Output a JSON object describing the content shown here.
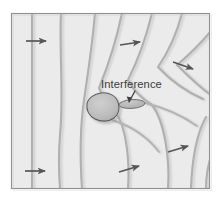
{
  "figure": {
    "frame": {
      "x": 11,
      "y": 13,
      "width": 199,
      "height": 176
    },
    "colors": {
      "page_background": "#ffffff",
      "field_background": "#ebebeb",
      "contour_line": "#b0b0b0",
      "contour_shadow": "#d8d8d8",
      "frame_border": "#8f8f8f",
      "arrow": "#55555a",
      "obstacle_fill": "#bdbdbd",
      "obstacle_outline": "#5c5c5c",
      "interference_fill": "#b8b8b8",
      "interference_outline": "#6a6a6a",
      "label_text": "#3b3b3b"
    },
    "annotations": [
      {
        "name": "interference-label",
        "text": "Interference",
        "text_x": 101,
        "text_y": 88,
        "leader_from": {
          "x": 134,
          "y": 92
        },
        "leader_to": {
          "x": 128,
          "y": 103
        }
      }
    ],
    "obstacle": {
      "name": "obstacle-blob",
      "center": {
        "x": 103,
        "y": 107
      },
      "radius_x": 16,
      "radius_y": 14
    },
    "interference_zone": {
      "name": "interference-ellipse",
      "center": {
        "x": 132,
        "y": 104
      },
      "radius_x": 13,
      "radius_y": 4.5,
      "rotation_deg": -4
    },
    "flow_arrows": [
      {
        "name": "flow-arrow-upper-left",
        "x1": 26,
        "y1": 41,
        "x2": 47,
        "y2": 41
      },
      {
        "name": "flow-arrow-upper-middle",
        "x1": 120,
        "y1": 45,
        "x2": 141,
        "y2": 42
      },
      {
        "name": "flow-arrow-upper-right",
        "x1": 173,
        "y1": 62,
        "x2": 194,
        "y2": 69
      },
      {
        "name": "flow-arrow-lower-left",
        "x1": 25,
        "y1": 171,
        "x2": 46,
        "y2": 171
      },
      {
        "name": "flow-arrow-lower-middle",
        "x1": 119,
        "y1": 172,
        "x2": 140,
        "y2": 166
      },
      {
        "name": "flow-arrow-lower-right",
        "x1": 168,
        "y1": 152,
        "x2": 189,
        "y2": 146
      }
    ],
    "contours": [
      {
        "name": "contour-1-straight",
        "path": "M 32 13 L 32 189"
      },
      {
        "name": "contour-2",
        "path": "M 61 13 C 59 50, 64 95, 60 135 C 58 160, 59 175, 60 189"
      },
      {
        "name": "contour-3",
        "path": "M 95 13 C 92 48, 88 72, 84 100 C 80 128, 80 160, 82 189"
      },
      {
        "name": "contour-4",
        "path": "M 122 13 C 116 42, 108 66, 99 88 C 106 104, 112 112, 120 118 C 128 132, 130 162, 128 189"
      },
      {
        "name": "contour-5",
        "path": "M 152 13 C 146 38, 138 60, 128 80 C 135 92, 144 100, 155 106 C 167 124, 170 160, 168 189"
      },
      {
        "name": "contour-6",
        "path": "M 182 13 C 176 34, 168 52, 157 68 C 172 84, 188 94, 205 100"
      },
      {
        "name": "contour-7",
        "path": "M 209 30 C 198 44, 188 56, 176 66 C 192 82, 206 94, 210 100"
      },
      {
        "name": "contour-8",
        "path": "M 205 118 C 196 134, 191 160, 190 189"
      }
    ],
    "wake_lines": [
      {
        "name": "wake-line-upper",
        "path": "M 146 102 C 163 106, 180 113, 196 124"
      },
      {
        "name": "wake-line-lower",
        "path": "M 112 119 C 128 124, 145 134, 158 150"
      }
    ]
  }
}
